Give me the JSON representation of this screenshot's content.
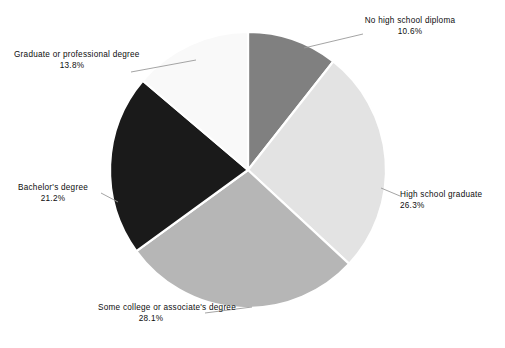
{
  "chart_data": {
    "type": "pie",
    "title": "",
    "subtitle": "",
    "xlabel": "",
    "ylabel": "",
    "legend_position": "none",
    "grid": false,
    "start_angle_deg": 90,
    "direction": "clockwise",
    "categories": [
      "No high school diploma",
      "High school graduate",
      "Some college or associate's degree",
      "Bachelor's degree",
      "Graduate or professional degree"
    ],
    "values": [
      10.6,
      26.3,
      28.1,
      21.2,
      13.8
    ],
    "value_labels": [
      "10.6%",
      "26.3%",
      "28.1%",
      "21.2%",
      "13.8%"
    ],
    "colors": [
      "#808080",
      "#e3e3e3",
      "#b6b6b6",
      "#1a1a1a",
      "#f9f9f9"
    ],
    "slices": [
      {
        "label_line1": "No high school",
        "label_line2": "diploma",
        "percent": "10.6%",
        "value": 10.6,
        "color": "#808080"
      },
      {
        "label_line1": "High school graduate",
        "label_line2": "",
        "percent": "26.3%",
        "value": 26.3,
        "color": "#e3e3e3"
      },
      {
        "label_line1": "Some college or",
        "label_line2": "associate's degree",
        "percent": "28.1%",
        "value": 28.1,
        "color": "#b6b6b6"
      },
      {
        "label_line1": "Bachelor's degree",
        "label_line2": "",
        "percent": "21.2%",
        "value": 21.2,
        "color": "#1a1a1a"
      },
      {
        "label_line1": "Graduate or",
        "label_line2": "professional degree",
        "percent": "13.8%",
        "value": 13.8,
        "color": "#f9f9f9"
      }
    ]
  },
  "canvas": {
    "background": "#ffffff",
    "leader_line_color": "#9a9a9a",
    "slice_border_color": "#ffffff"
  }
}
